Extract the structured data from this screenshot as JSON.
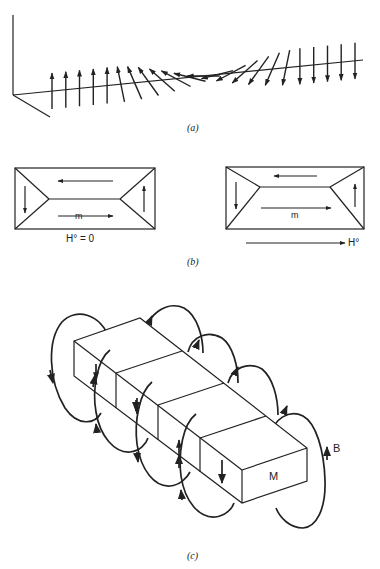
{
  "figure": {
    "panels": [
      {
        "id": "a",
        "caption": "(a)",
        "description": "Domain wall: spin rotation from up to down along an axis",
        "spin_count": 23
      },
      {
        "id": "b",
        "caption": "(b)",
        "left": {
          "moment_label": "m",
          "field_label": "H° = 0"
        },
        "right": {
          "moment_label": "m",
          "field_label": "H°"
        }
      },
      {
        "id": "c",
        "caption": "(c)",
        "magnetization_label": "M",
        "field_label": "B"
      }
    ]
  },
  "labels": {
    "a_caption": "(a)",
    "b_caption": "(b)",
    "c_caption": "(c)",
    "b_left_m": "m",
    "b_left_h": "H° = 0",
    "b_right_m": "m",
    "b_right_h": "H°",
    "c_M": "M",
    "c_B": "B"
  }
}
